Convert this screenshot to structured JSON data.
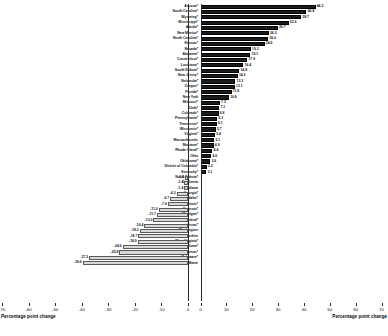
{
  "chart_data": {
    "type": "bar",
    "title": "",
    "subtitle": "",
    "orientation": "horizontal-diverging",
    "xlabel_left": "Percentage point change",
    "xlabel_right": "Percentage point change",
    "ylabel": "",
    "grid": false,
    "legend": null,
    "left_axis": {
      "ticks": [
        "-70",
        "-60",
        "-50",
        "-40",
        "-30",
        "-20",
        "-10",
        "0"
      ],
      "tick_values": [
        -70,
        -60,
        -50,
        -40,
        -30,
        -20,
        -10,
        0
      ],
      "xlim": [
        -70,
        0
      ],
      "label": "Percentage point change"
    },
    "right_axis": {
      "ticks": [
        "0",
        "10",
        "20",
        "30",
        "40",
        "50",
        "60",
        "70"
      ],
      "tick_values": [
        0,
        10,
        20,
        30,
        40,
        50,
        60,
        70
      ],
      "xlim": [
        0,
        70
      ],
      "label": "Percentage point change"
    },
    "categories": [
      "Arizona*",
      "South Carolina*",
      "Wyoming*",
      "Mississippi*",
      "Alaska*",
      "New Mexico*",
      "North Carolina*",
      "Kansas*",
      "Nevada*",
      "Alabama*",
      "Connecticut*",
      "Louisiana*",
      "South Dakota*",
      "New Jersey*",
      "Nebraska*",
      "Oregon*",
      "Florida*",
      "New York",
      "Missouri*",
      "Utah*",
      "Colorado*",
      "Pennsylvania*",
      "Tennessee*",
      "Wisconsin*",
      "Virginia*",
      "Massachusetts",
      "Montana*",
      "Rhode Island*",
      "Ohio",
      "Oklahoma*",
      "District of Columbia*",
      "Kentucky*",
      "North Dakota*",
      "California",
      "Indiana",
      "Georgia*",
      "Idaho*",
      "Illinois*",
      "Vermont*",
      "Michigan*",
      "Maryland*",
      "Texas*",
      "Washington",
      "New Hampshire",
      "West Virginia*",
      "Iowa*",
      "Arkansas*",
      "Delaware*",
      "Maine"
    ],
    "values": [
      44.3,
      40.8,
      38.7,
      33.9,
      29.7,
      26.2,
      26.0,
      24.6,
      19.3,
      19.1,
      17.9,
      16.4,
      14.8,
      14.2,
      13.3,
      13.1,
      11.8,
      10.8,
      7.3,
      7.1,
      6.8,
      6.3,
      6.1,
      5.7,
      5.4,
      5.1,
      4.9,
      4.4,
      4.0,
      3.6,
      2.2,
      2.1,
      -1.1,
      -1.4,
      -1.4,
      -4.3,
      -6.7,
      -7.6,
      -11.0,
      -11.7,
      -13.0,
      -16.4,
      -18.2,
      -18.7,
      -18.9,
      -24.6,
      -25.8,
      -37.2,
      -39.6
    ],
    "bar_styles": {
      "positive_color": "#1b1b1b",
      "negative_color": "#d8d8d8",
      "negative_border": "#5a5a5a"
    },
    "rows": [
      {
        "state": "Arizona*",
        "value": 44.3,
        "label": "44.3"
      },
      {
        "state": "South Carolina*",
        "value": 40.8,
        "label": "40.8"
      },
      {
        "state": "Wyoming*",
        "value": 38.7,
        "label": "38.7"
      },
      {
        "state": "Mississippi*",
        "value": 33.9,
        "label": "33.9"
      },
      {
        "state": "Alaska*",
        "value": 29.7,
        "label": "29.7"
      },
      {
        "state": "New Mexico*",
        "value": 26.2,
        "label": "26.2"
      },
      {
        "state": "North Carolina*",
        "value": 26.0,
        "label": "26.0"
      },
      {
        "state": "Kansas*",
        "value": 24.6,
        "label": "24.6"
      },
      {
        "state": "Nevada*",
        "value": 19.3,
        "label": "19.3"
      },
      {
        "state": "Alabama*",
        "value": 19.1,
        "label": "19.1"
      },
      {
        "state": "Connecticut*",
        "value": 17.9,
        "label": "17.9"
      },
      {
        "state": "Louisiana*",
        "value": 16.4,
        "label": "16.4"
      },
      {
        "state": "South Dakota*",
        "value": 14.8,
        "label": "14.8"
      },
      {
        "state": "New Jersey*",
        "value": 14.2,
        "label": "14.2"
      },
      {
        "state": "Nebraska*",
        "value": 13.3,
        "label": "13.3"
      },
      {
        "state": "Oregon*",
        "value": 13.1,
        "label": "13.1"
      },
      {
        "state": "Florida*",
        "value": 11.8,
        "label": "11.8"
      },
      {
        "state": "New York",
        "value": 10.8,
        "label": "10.8"
      },
      {
        "state": "Missouri*",
        "value": 7.3,
        "label": "7.3"
      },
      {
        "state": "Utah*",
        "value": 7.1,
        "label": "7.1"
      },
      {
        "state": "Colorado*",
        "value": 6.8,
        "label": "6.8"
      },
      {
        "state": "Pennsylvania*",
        "value": 6.3,
        "label": "6.3"
      },
      {
        "state": "Tennessee*",
        "value": 6.1,
        "label": "6.1"
      },
      {
        "state": "Wisconsin*",
        "value": 5.7,
        "label": "5.7"
      },
      {
        "state": "Virginia*",
        "value": 5.4,
        "label": "5.4"
      },
      {
        "state": "Massachusetts",
        "value": 5.1,
        "label": "5.1"
      },
      {
        "state": "Montana*",
        "value": 4.9,
        "label": "4.9"
      },
      {
        "state": "Rhode Island*",
        "value": 4.4,
        "label": "4.4"
      },
      {
        "state": "Ohio",
        "value": 4.0,
        "label": "4.0"
      },
      {
        "state": "Oklahoma*",
        "value": 3.6,
        "label": "3.6"
      },
      {
        "state": "District of Columbia*",
        "value": 2.2,
        "label": "2.2"
      },
      {
        "state": "Kentucky*",
        "value": 2.1,
        "label": "2.1"
      },
      {
        "state": "North Dakota*",
        "value": -1.1,
        "label": "-1.1"
      },
      {
        "state": "California",
        "value": -1.4,
        "label": "-1.4"
      },
      {
        "state": "Indiana",
        "value": -1.4,
        "label": "-1.4"
      },
      {
        "state": "Georgia*",
        "value": -4.3,
        "label": "-4.3"
      },
      {
        "state": "Idaho*",
        "value": -6.7,
        "label": "-6.7"
      },
      {
        "state": "Illinois*",
        "value": -7.6,
        "label": "-7.6"
      },
      {
        "state": "Vermont*",
        "value": -11.0,
        "label": "-11.0"
      },
      {
        "state": "Michigan*",
        "value": -11.7,
        "label": "-11.7"
      },
      {
        "state": "Maryland*",
        "value": -13.0,
        "label": "-13.0"
      },
      {
        "state": "Texas*",
        "value": -16.4,
        "label": "-16.4"
      },
      {
        "state": "Washington",
        "value": -18.2,
        "label": "-18.2"
      },
      {
        "state": "New Hampshire",
        "value": -18.7,
        "label": "-18.7"
      },
      {
        "state": "West Virginia*",
        "value": -18.9,
        "label": "-18.9"
      },
      {
        "state": "Iowa*",
        "value": -24.6,
        "label": "-24.6"
      },
      {
        "state": "Arkansas*",
        "value": -25.8,
        "label": "-25.8"
      },
      {
        "state": "Delaware*",
        "value": -37.2,
        "label": "-37.2"
      },
      {
        "state": "Maine",
        "value": -39.6,
        "label": "-39.6"
      }
    ]
  }
}
